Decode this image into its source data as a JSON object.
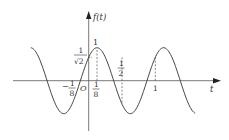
{
  "chart_data": {
    "type": "line",
    "title": "",
    "function": "f(t) = cos(2πt − π/4)",
    "xlabel": "t",
    "ylabel": "f(t)",
    "x_range": [
      -0.87,
      1.6
    ],
    "y_range": [
      -1,
      1
    ],
    "origin_label": "O",
    "tick_labels": {
      "x": [
        {
          "t": -0.125,
          "num": "1",
          "den": "8",
          "sign": "−"
        },
        {
          "t": 0.125,
          "num": "1",
          "den": "8",
          "sign": ""
        },
        {
          "t": 0.5,
          "num": "1",
          "den": "2",
          "sign": ""
        },
        {
          "t": 1,
          "text": "1"
        }
      ],
      "y": [
        {
          "v": 1,
          "text": "1"
        },
        {
          "v": 0.7071,
          "num": "1",
          "den": "√2"
        }
      ]
    },
    "dashed_guides": [
      {
        "t": 0.125,
        "from": 0,
        "to": 1
      },
      {
        "t": 0.5,
        "from": 0.7071,
        "to": -0.7071
      },
      {
        "t": 1,
        "from": 0,
        "to": 0.7071
      }
    ],
    "grid": false,
    "legend": null
  },
  "labels": {
    "y_axis": "f(t)",
    "x_axis": "t",
    "origin": "O",
    "one_top": "1",
    "sqrt_num": "1",
    "sqrt_den": "√2",
    "neg_eighth_sign": "−",
    "neg_eighth_num": "1",
    "neg_eighth_den": "8",
    "eighth_num": "1",
    "eighth_den": "8",
    "half_num": "1",
    "half_den": "2",
    "one_x": "1"
  },
  "colors": {
    "curve": "#444444",
    "axis": "#555555",
    "text": "#333333"
  }
}
